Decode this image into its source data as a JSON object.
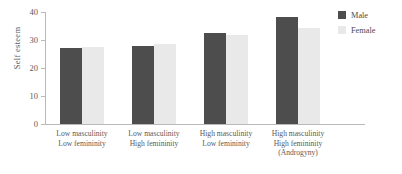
{
  "chart_data": {
    "type": "bar",
    "title": "",
    "xlabel": "",
    "ylabel": "Self esteem",
    "ylim": [
      0,
      40
    ],
    "yticks": [
      0,
      10,
      20,
      30,
      40
    ],
    "ytick_labels": [
      "0",
      "10",
      "20",
      "30",
      "40"
    ],
    "grid": false,
    "legend_position": "top-right",
    "categories": [
      [
        "Low masculinity",
        "Low femininity"
      ],
      [
        "Low masculinity",
        "High femininity"
      ],
      [
        "High masculinity",
        "Low femininity"
      ],
      [
        "High masculinity",
        "High femininity",
        "(Androgyny)"
      ]
    ],
    "series": [
      {
        "name": "Male",
        "color": "#4d4d4d",
        "values": [
          27,
          27.8,
          32.6,
          38.2
        ]
      },
      {
        "name": "Female",
        "color": "#e9e9e9",
        "values": [
          27.6,
          28.6,
          31.8,
          34.4
        ]
      }
    ]
  },
  "legend": {
    "items": [
      {
        "label": "Male"
      },
      {
        "label": "Female"
      }
    ]
  },
  "axis": {
    "y_label": "Self esteem",
    "tick_0": "0",
    "tick_10": "10",
    "tick_20": "20",
    "tick_30": "30",
    "tick_40": "40"
  },
  "categories_text": {
    "g0_l0": "Low masculinity",
    "g0_l1": "Low femininity",
    "g1_l0": "Low masculinity",
    "g1_l1": "High femininity",
    "g2_l0": "High masculinity",
    "g2_l1": "Low femininity",
    "g3_l0": "High masculinity",
    "g3_l1": "High femininity",
    "g3_l2": "(Androgyny)"
  }
}
